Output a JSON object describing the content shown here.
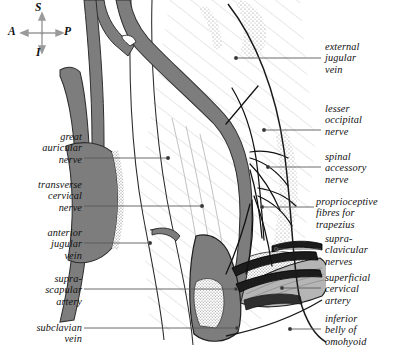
{
  "figure": {
    "background_color": "#ffffff",
    "ink_color": "#111111",
    "vein_color": "#7d7d7d",
    "artery_color": "#1c1c1c",
    "muscle_color": "#b5b5b5",
    "bone_stipple_color": "#8a8a8a",
    "leader_color": "#5a5a5a"
  },
  "orientation_compass": {
    "name": "orientation-compass",
    "superior": "S",
    "anterior": "A",
    "posterior": "P",
    "inferior": "I"
  },
  "labels_left": [
    {
      "id": "great-auricular-nerve",
      "text": "great\nauricular\nnerve",
      "x": 4,
      "y": 131,
      "w": 78,
      "leader_y": 158,
      "leader_x1": 84,
      "leader_x2": 168
    },
    {
      "id": "transverse-cervical-nerve",
      "text": "transverse\ncervical\nnerve",
      "x": 4,
      "y": 179,
      "w": 78,
      "leader_y": 206,
      "leader_x1": 84,
      "leader_x2": 202
    },
    {
      "id": "anterior-jugular-vein",
      "text": "anterior\njugular\nvein",
      "x": 4,
      "y": 227,
      "w": 78,
      "leader_y": 243,
      "leader_x1": 84,
      "leader_x2": 150
    },
    {
      "id": "suprascapular-artery",
      "text": "supra-\nscapular\nartery",
      "x": 4,
      "y": 273,
      "w": 78,
      "leader_y": 289,
      "leader_x1": 84,
      "leader_x2": 236
    },
    {
      "id": "subclavian-vein",
      "text": "subclavian\nvein",
      "x": 4,
      "y": 322,
      "w": 78,
      "leader_y": 328,
      "leader_x1": 84,
      "leader_x2": 237
    }
  ],
  "labels_right": [
    {
      "id": "external-jugular-vein",
      "text": "external\njugular\nvein",
      "x": 325,
      "y": 41,
      "w": 68,
      "leader_y": 58,
      "leader_x1": 236,
      "leader_x2": 321
    },
    {
      "id": "lesser-occipital-nerve",
      "text": "lesser\noccipital\nnerve",
      "x": 325,
      "y": 103,
      "w": 68,
      "leader_y": 130,
      "leader_x1": 264,
      "leader_x2": 321
    },
    {
      "id": "spinal-accessory-nerve",
      "text": "spinal\naccessory\nnerve",
      "x": 325,
      "y": 151,
      "w": 68,
      "leader_y": 167,
      "leader_x1": 268,
      "leader_x2": 321
    },
    {
      "id": "proprioceptive-fibres-for-trapezius",
      "text": "proprioceptive\nfibres for\ntrapezius",
      "x": 316,
      "y": 196,
      "w": 77,
      "leader_y": 207,
      "leader_x1": 262,
      "leader_x2": 314
    },
    {
      "id": "supraclavicular-nerves",
      "text": "supra-\nclavicular\nnerves",
      "x": 325,
      "y": 233,
      "w": 68,
      "leader_y": 249,
      "leader_x1": 276,
      "leader_x2": 321
    },
    {
      "id": "superficial-cervical-artery",
      "text": "superficial\ncervical\nartery",
      "x": 325,
      "y": 272,
      "w": 68,
      "leader_y": 288,
      "leader_x1": 282,
      "leader_x2": 321
    },
    {
      "id": "inferior-belly-of-omohyoid",
      "text": "inferior\nbelly of\nomohyoid",
      "x": 325,
      "y": 313,
      "w": 68,
      "leader_y": 329,
      "leader_x1": 290,
      "leader_x2": 321
    }
  ]
}
